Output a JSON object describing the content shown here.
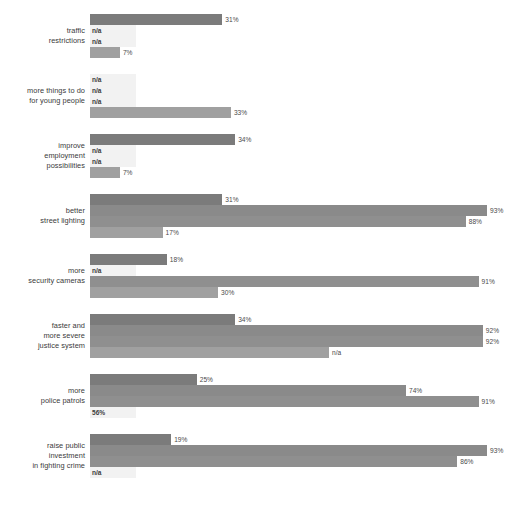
{
  "chart_data": {
    "type": "bar",
    "orientation": "horizontal",
    "title": "",
    "subtitle": "",
    "xlabel": "",
    "ylabel": "",
    "xlim": [
      0,
      100
    ],
    "grid": false,
    "legend": "none",
    "value_suffix": "%",
    "missing_label": "n/a",
    "px_per_percent": 4.27,
    "categories": [
      "traffic\nrestrictions",
      "more things to do\nfor young people",
      "improve\nemployment\npossibilities",
      "better\nstreet lighting",
      "more\nsecurity cameras",
      "faster and\nmore severe\njustice system",
      "more\npolice patrols",
      "raise public\ninvestment\nin fighting crime"
    ],
    "series": [
      {
        "name": "series-1",
        "color": "#7b7b7b",
        "values": [
          31,
          null,
          34,
          31,
          18,
          34,
          25,
          19
        ]
      },
      {
        "name": "series-2",
        "color": "#8a8a8a",
        "values": [
          null,
          null,
          null,
          93,
          null,
          92,
          74,
          93
        ]
      },
      {
        "name": "series-3",
        "color": "#8f8f8f",
        "values": [
          null,
          null,
          null,
          88,
          91,
          92,
          91,
          86
        ]
      },
      {
        "name": "series-4",
        "color": "#a0a0a0",
        "values": [
          7,
          33,
          7,
          17,
          30,
          56,
          null,
          null
        ]
      }
    ],
    "labels": [
      [
        "31%",
        "n/a",
        "n/a",
        "7%"
      ],
      [
        "n/a",
        "n/a",
        "n/a",
        "33%"
      ],
      [
        "34%",
        "n/a",
        "n/a",
        "7%"
      ],
      [
        "31%",
        "93%",
        "88%",
        "17%"
      ],
      [
        "18%",
        "n/a",
        "91%",
        "30%"
      ],
      [
        "34%",
        "92%",
        "92%",
        "n/a"
      ],
      [
        "25%",
        "74%",
        "91%",
        "56%"
      ],
      [
        "19%",
        "93%",
        "86%",
        "n/a"
      ]
    ]
  }
}
